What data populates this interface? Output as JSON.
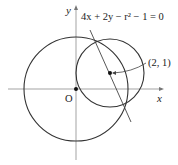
{
  "diagram": {
    "equation_label": "4x + 2y − r² − 1 = 0",
    "point_label": "(2, 1)",
    "origin_label": "O",
    "x_axis_label": "x",
    "y_axis_label": "y",
    "colors": {
      "stroke": "#333333",
      "axis": "#888888",
      "background": "#ffffff"
    },
    "elements": {
      "big_circle": {
        "center": "O",
        "description": "circle centered at origin"
      },
      "small_circle": {
        "center": "(2, 1)",
        "description": "circle of radius r centered at (2, 1)"
      },
      "chord_line": {
        "equation": "4x + 2y − r² − 1 = 0",
        "description": "common chord line through intersection points"
      }
    }
  }
}
